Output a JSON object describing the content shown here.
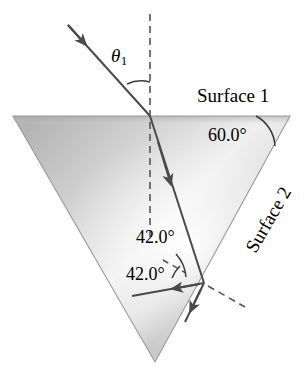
{
  "figure": {
    "background_color": "#ffffff",
    "width": 305,
    "height": 375
  },
  "prism": {
    "shape": "triangle",
    "vertices": [
      [
        13,
        116
      ],
      [
        290,
        116
      ],
      [
        155,
        362
      ]
    ],
    "fill_light": "#f2f2f2",
    "fill_mid": "#cfcfcf",
    "fill_dark": "#a9a9a9",
    "edge_color": "#8c8c8c"
  },
  "labels": {
    "surface_1": "Surface 1",
    "surface_2": "Surface 2",
    "apex_angle": "60.0°",
    "incidence_internal": "42.0°",
    "reflection_internal": "42.0°",
    "incident_angle_symbol": "θ",
    "incident_angle_subscript": "1"
  },
  "rays": {
    "line_color": "#4a4a4a",
    "incident": {
      "from": [
        68,
        25
      ],
      "to": [
        150,
        116
      ],
      "arrow_at": [
        83,
        41
      ]
    },
    "refracted_inside": {
      "from": [
        150,
        116
      ],
      "to": [
        204,
        283
      ],
      "arrow_at": [
        177,
        200
      ]
    },
    "reflected_internal": {
      "from": [
        204,
        283
      ],
      "to": [
        134,
        296
      ],
      "arrow_at": [
        163,
        290
      ]
    },
    "transmitted_out": {
      "from": [
        204,
        283
      ],
      "to": [
        186,
        320
      ],
      "arrow_at": [
        192,
        309
      ]
    }
  },
  "normals": {
    "color": "#5a5a5a",
    "style": "dashed",
    "surface_1_normal": {
      "from": [
        150,
        14
      ],
      "to": [
        150,
        242
      ]
    },
    "surface_2_normal": {
      "from": [
        163,
        262
      ],
      "to": [
        243,
        308
      ]
    }
  },
  "arcs": {
    "color": "#3a3a3a",
    "theta1_arc": "between incident ray and surface-1 normal",
    "apex_arc": "60.0 degrees at right vertex between surface 1 and surface 2",
    "incidence_arc": "42.0 degrees between inside ray and surface-2 normal",
    "reflection_arc": "42.0 degrees between surface-2 normal and reflected ray"
  }
}
